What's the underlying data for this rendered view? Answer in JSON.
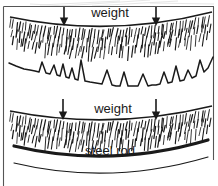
{
  "figure": {
    "title_alt": "Loaded soil layers with seismic trace and steel rod",
    "background_color": "#ffffff",
    "ink_color": "#1a1a1a",
    "frame": {
      "left_border": true,
      "top_border": true,
      "right_border": true,
      "x0": 3,
      "y0": 6,
      "x1": 214,
      "y1": 186
    }
  },
  "labels": {
    "weight_top": "weight",
    "weight_bottom": "weight",
    "steel_rod": "steel rod"
  },
  "label_positions": {
    "weight_top": {
      "x": 110,
      "y": 14
    },
    "weight_bottom": {
      "x": 113,
      "y": 110
    },
    "steel_rod": {
      "x": 110,
      "y": 152
    }
  },
  "arrows": [
    {
      "name": "weight-arrow-top-left",
      "x": 64,
      "y_start": 7,
      "y_end": 26
    },
    {
      "name": "weight-arrow-top-right",
      "x": 156,
      "y_start": 7,
      "y_end": 26
    },
    {
      "name": "weight-arrow-bottom-left",
      "x": 63,
      "y_start": 99,
      "y_end": 120
    },
    {
      "name": "weight-arrow-bottom-right",
      "x": 156,
      "y_start": 99,
      "y_end": 120
    }
  ],
  "layers": [
    {
      "name": "upper-soil-layer",
      "type": "hatched-ground",
      "surface_path": "M 10 17 Q 110 38 212 12",
      "hatch_count": 64,
      "hatch_length": 13,
      "hatch_angle_deg": 72,
      "band_depth": 30
    },
    {
      "name": "seismic-trace",
      "type": "waveform",
      "baseline_path": "M 9 63 Q 110 86 213 57"
    },
    {
      "name": "lower-soil-layer",
      "type": "hatched-ground",
      "surface_path": "M 10 111 Q 110 131 212 106",
      "hatch_count": 64,
      "hatch_length": 13,
      "hatch_angle_deg": 72,
      "band_depth": 30
    },
    {
      "name": "steel-rod",
      "type": "thick-curve",
      "path": "M 14 146 Q 110 169 208 140",
      "stroke_width": 3.2
    },
    {
      "name": "base-curve",
      "type": "thin-curve",
      "path": "M 14 163 Q 110 186 208 157",
      "stroke_width": 1.2
    }
  ],
  "chart_data": {
    "type": "line",
    "title": "",
    "xlabel": "",
    "ylabel": "",
    "legend": [],
    "grid": false,
    "x": [
      9,
      16,
      24,
      30,
      35,
      39,
      42,
      46,
      50,
      54,
      57,
      60,
      63,
      66,
      69,
      72,
      75,
      78,
      81,
      85,
      90,
      96,
      102,
      107,
      112,
      116,
      120,
      124,
      128,
      133,
      138,
      143,
      148,
      152,
      156,
      160,
      164,
      168,
      172,
      176,
      180,
      184,
      188,
      192,
      196,
      200,
      204,
      208,
      213
    ],
    "values": [
      63,
      66,
      69,
      70,
      71,
      72,
      62,
      73,
      74,
      65,
      75,
      76,
      64,
      77,
      78,
      68,
      79,
      80,
      60,
      81,
      82,
      83,
      84,
      70,
      85,
      86,
      86,
      72,
      86,
      86,
      86,
      74,
      86,
      85,
      85,
      84,
      72,
      83,
      82,
      66,
      81,
      80,
      70,
      78,
      76,
      60,
      72,
      68,
      57
    ],
    "ylim": [
      55,
      90
    ],
    "note": "Jagged seismogram-like trace: gently sagging baseline with ~12 sharp upward spikes"
  }
}
